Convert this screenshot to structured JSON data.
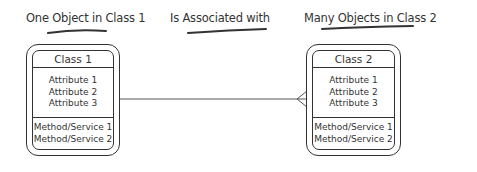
{
  "captions": {
    "left": "One Object in Class 1",
    "middle": "Is Associated with",
    "right": "Many Objects in Class 2"
  },
  "classes": [
    {
      "name": "Class 1",
      "attributes": [
        "Attribute 1",
        "Attribute 2",
        "Attribute 3"
      ],
      "methods": [
        "Method/Service 1",
        "Method/Service 2"
      ]
    },
    {
      "name": "Class 2",
      "attributes": [
        "Attribute 1",
        "Attribute 2",
        "Attribute 3"
      ],
      "methods": [
        "Method/Service 1",
        "Method/Service 2"
      ]
    }
  ],
  "association": {
    "left_end": "one",
    "right_end": "many (crow's foot)"
  },
  "colors": {
    "line": "#333333",
    "text": "#333333",
    "background": "#ffffff"
  }
}
